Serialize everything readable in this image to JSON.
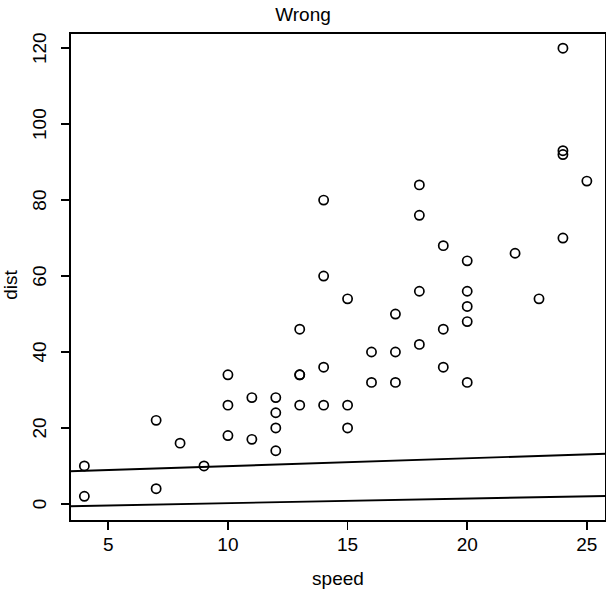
{
  "chart_data": {
    "type": "scatter",
    "title": "Wrong",
    "xlabel": "speed",
    "ylabel": "dist",
    "xlim": [
      3.4,
      25.8
    ],
    "ylim": [
      -4.5,
      124
    ],
    "grid": false,
    "legend": null,
    "marker": "open-circle",
    "xticks": [
      5,
      10,
      15,
      20,
      25
    ],
    "yticks": [
      0,
      20,
      40,
      60,
      80,
      100,
      120
    ],
    "xtick_labels": [
      "5",
      "10",
      "15",
      "20",
      "25"
    ],
    "ytick_labels": [
      "0",
      "20",
      "40",
      "60",
      "80",
      "100",
      "120"
    ],
    "x": [
      4,
      4,
      7,
      7,
      8,
      9,
      10,
      10,
      10,
      11,
      11,
      12,
      12,
      12,
      12,
      13,
      13,
      13,
      13,
      14,
      14,
      14,
      14,
      15,
      15,
      15,
      16,
      16,
      17,
      17,
      17,
      18,
      18,
      18,
      18,
      19,
      19,
      19,
      20,
      20,
      20,
      20,
      20,
      22,
      23,
      24,
      24,
      24,
      24,
      25
    ],
    "y": [
      2,
      10,
      4,
      22,
      16,
      10,
      18,
      26,
      34,
      17,
      28,
      14,
      20,
      24,
      28,
      26,
      34,
      34,
      46,
      26,
      36,
      60,
      80,
      20,
      26,
      54,
      32,
      40,
      32,
      40,
      50,
      42,
      56,
      76,
      84,
      36,
      46,
      68,
      32,
      48,
      52,
      56,
      64,
      66,
      54,
      70,
      92,
      93,
      120,
      85
    ],
    "series": [
      {
        "name": "cars",
        "x": [
          4,
          4,
          7,
          7,
          8,
          9,
          10,
          10,
          10,
          11,
          11,
          12,
          12,
          12,
          12,
          13,
          13,
          13,
          13,
          14,
          14,
          14,
          14,
          15,
          15,
          15,
          16,
          16,
          17,
          17,
          17,
          18,
          18,
          18,
          18,
          19,
          19,
          19,
          20,
          20,
          20,
          20,
          20,
          22,
          23,
          24,
          24,
          24,
          24,
          25
        ],
        "values": [
          2,
          10,
          4,
          22,
          16,
          10,
          18,
          26,
          34,
          17,
          28,
          14,
          20,
          24,
          28,
          26,
          34,
          34,
          46,
          26,
          36,
          60,
          80,
          20,
          26,
          54,
          32,
          40,
          32,
          40,
          50,
          42,
          56,
          76,
          84,
          36,
          46,
          68,
          32,
          48,
          52,
          56,
          64,
          66,
          54,
          70,
          92,
          93,
          120,
          85
        ]
      }
    ],
    "lines": [
      {
        "name": "upper-fit-line",
        "x": [
          3.4,
          25.8
        ],
        "y": [
          8.6,
          13.2
        ]
      },
      {
        "name": "lower-fit-line",
        "x": [
          3.4,
          25.8
        ],
        "y": [
          -0.6,
          2.1
        ]
      }
    ],
    "annotations": []
  }
}
